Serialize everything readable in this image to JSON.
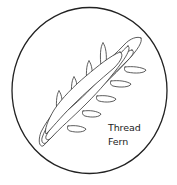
{
  "illustration": {
    "subject": "fern-icon",
    "label_lines": [
      "Thread",
      "Fern"
    ],
    "stroke_color": "#333333",
    "background_color": "#ffffff"
  }
}
